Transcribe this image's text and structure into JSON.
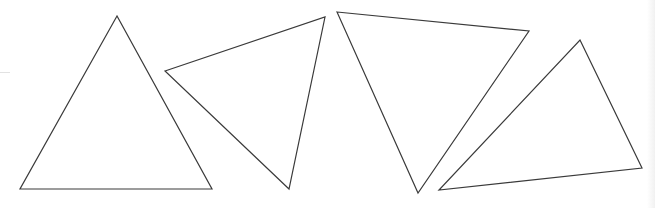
{
  "canvas": {
    "width": 655,
    "height": 208,
    "background": "#ffffff",
    "stroke_color": "#3a3a3a"
  },
  "triangles": [
    {
      "id": "triangle-1",
      "points": "117,16 20,189 212,189"
    },
    {
      "id": "triangle-2",
      "points": "165,71 325,17 289,189"
    },
    {
      "id": "triangle-3",
      "points": "337,12 529,31 418,193"
    },
    {
      "id": "triangle-4",
      "points": "580,40 642,168 439,190"
    }
  ]
}
